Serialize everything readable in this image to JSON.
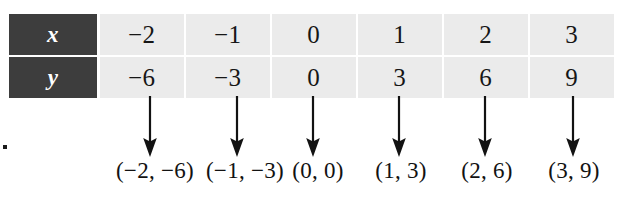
{
  "figure": {
    "kind": "function-table-with-ordered-pairs",
    "stray_mark": "."
  },
  "table": {
    "header_bg": "#3d3d3d",
    "header_text_color": "#ffffff",
    "cell_bg": "#ebebeb",
    "cell_text_color": "#161616",
    "rows": [
      {
        "header": "x",
        "values": [
          "−2",
          "−1",
          "0",
          "1",
          "2",
          "3"
        ]
      },
      {
        "header": "y",
        "values": [
          "−6",
          "−3",
          "0",
          "3",
          "6",
          "9"
        ]
      }
    ]
  },
  "arrows": {
    "count": 6,
    "color": "#121212",
    "positions_x": [
      150,
      237,
      313,
      399,
      485,
      573
    ]
  },
  "ordered_pairs": {
    "labels": [
      "(−2, −6)",
      "(−1, −3)",
      "(0, 0)",
      "(1, 3)",
      "(2, 6)",
      "(3, 9)"
    ],
    "positions_x": [
      155,
      245,
      318,
      401,
      487,
      574
    ]
  }
}
